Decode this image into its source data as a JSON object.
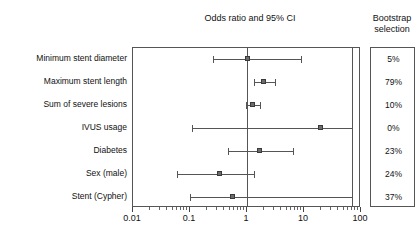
{
  "header": {
    "plot_title": "Odds ratio and 95% CI",
    "bootstrap_title_line1": "Bootstrap",
    "bootstrap_title_line2": "selection"
  },
  "chart_data": {
    "type": "forest",
    "title": "Odds ratio and 95% CI",
    "xlabel": "",
    "ylabel": "",
    "xscale": "log",
    "xlim": [
      0.01,
      100
    ],
    "xticks": [
      0.01,
      0.1,
      1,
      10,
      100
    ],
    "xticklabels": [
      "0.01",
      "0.1",
      "1",
      "10",
      "100"
    ],
    "reference_line": 1,
    "clip_line": 70,
    "grid": false,
    "legend": "none",
    "marker_style": "square",
    "marker_color": "#6c6c6c",
    "line_color": "#555555",
    "categories": [
      "Minimum stent diameter",
      "Maximum stent length",
      "Sum of severe lesions",
      "IVUS usage",
      "Diabetes",
      "Sex (male)",
      "Stent (Cypher)"
    ],
    "odds_ratio": [
      1.05,
      2.0,
      1.25,
      20.0,
      1.7,
      0.33,
      0.57
    ],
    "ci_low": [
      0.25,
      1.35,
      0.95,
      0.11,
      0.47,
      0.06,
      0.1
    ],
    "ci_high": [
      8.7,
      3.1,
      1.7,
      null,
      6.5,
      1.35,
      null
    ],
    "ci_high_clipped": [
      false,
      false,
      false,
      true,
      false,
      false,
      true
    ],
    "bootstrap_selection": [
      "5%",
      "79%",
      "10%",
      "0%",
      "23%",
      "24%",
      "37%"
    ]
  }
}
